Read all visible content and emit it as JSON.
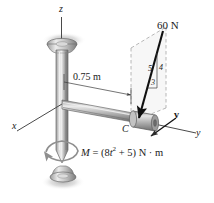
{
  "figure": {
    "type": "engineering-mechanics-diagram",
    "background_color": "#ffffff",
    "ink_color": "#1a1a1a"
  },
  "axes": {
    "x_label": "x",
    "y_label": "y",
    "z_label": "z"
  },
  "labels": {
    "force_magnitude": "60 N",
    "dimension": "0.75 m",
    "point_c": "C",
    "velocity_vector": "v",
    "moment_prefix": "M",
    "moment_equals": "=",
    "moment_open": "(8",
    "moment_var": "t",
    "moment_exp": "2",
    "moment_rest": " + 5)",
    "moment_units": "N · m",
    "moment_full": "M = (8t2 + 5) N · m"
  },
  "slope_triangle": {
    "hypotenuse": "5",
    "vertical": "4",
    "horizontal": "3"
  },
  "colors": {
    "shaft_light": "#e8e8e8",
    "shaft_mid": "#b8b8b8",
    "shaft_dark": "#808080",
    "shaft_darkest": "#585858",
    "collar_light": "#d8d8d8",
    "collar_dark": "#787878",
    "shadow": "#c9c9c9",
    "plane_fill": "#f2f2f2",
    "dash": "#9a9a9a",
    "arrow": "#111111"
  }
}
